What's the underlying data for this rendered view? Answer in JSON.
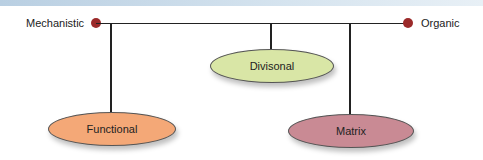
{
  "diagram": {
    "left_endpoint": {
      "label": "Mechanistic",
      "color": "#9b2a2a"
    },
    "right_endpoint": {
      "label": "Organic",
      "color": "#9b2a2a"
    },
    "nodes": [
      {
        "label": "Functional",
        "fill": "#f4a877"
      },
      {
        "label": "Divisonal",
        "fill": "#d9e6a6"
      },
      {
        "label": "Matrix",
        "fill": "#c98a94"
      }
    ]
  }
}
